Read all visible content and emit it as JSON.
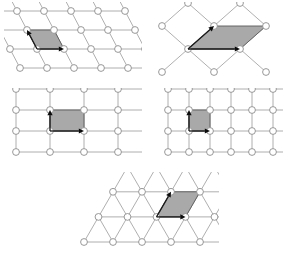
{
  "figure": {
    "background_color": "#ffffff",
    "width": 283,
    "height": 262,
    "style": {
      "edge_color": "#9a9a9a",
      "node_stroke_color": "#8c8c8c",
      "node_fill_color": "#ffffff",
      "node_radius": 3.4,
      "unit_cell_fill_color": "#a9a9a9",
      "unit_cell_stroke_color": "#5a5a5a",
      "vector_color": "#0d0d0d"
    }
  },
  "lattices": [
    {
      "id": "oblique",
      "name": "oblique-lattice",
      "panel": {
        "x": 4,
        "y": 2,
        "width": 138,
        "height": 82
      },
      "lattice_type": "oblique",
      "origin": {
        "x": 16,
        "y": 66
      },
      "a1": {
        "dx": 27,
        "dy": 0
      },
      "a2": {
        "dx": -10,
        "dy": -19
      },
      "cols": 5,
      "rows": 4,
      "unit_cell_origin_index": {
        "col": 1,
        "row": 1
      },
      "unit_cell_shape": "parallelogram",
      "vectors": [
        {
          "label": "a1",
          "direction": "right"
        },
        {
          "label": "a2",
          "direction": "up-left"
        }
      ]
    },
    {
      "id": "centered-rectangular",
      "name": "centered-rectangular-lattice",
      "panel": {
        "x": 150,
        "y": 2,
        "width": 133,
        "height": 82
      },
      "lattice_type": "centered rectangular (rhombic net)",
      "origin": {
        "x": 12,
        "y": 70
      },
      "a1": {
        "dx": 52,
        "dy": 0
      },
      "a2": {
        "dx": 26,
        "dy": -23
      },
      "cols": 3,
      "rows": 4,
      "unit_cell_shape": "rhombus",
      "vectors": [
        {
          "label": "a1",
          "direction": "right"
        },
        {
          "label": "a2",
          "direction": "up-left"
        }
      ]
    },
    {
      "id": "rectangular",
      "name": "rectangular-lattice",
      "panel": {
        "x": 4,
        "y": 88,
        "width": 138,
        "height": 82
      },
      "lattice_type": "rectangular",
      "origin": {
        "x": 12,
        "y": 64
      },
      "a1": {
        "dx": 34,
        "dy": 0
      },
      "a2": {
        "dx": 0,
        "dy": -21
      },
      "cols": 5,
      "rows": 4,
      "unit_cell_origin_index": {
        "col": 1,
        "row": 1
      },
      "unit_cell_shape": "rectangle",
      "vectors": [
        {
          "label": "a1",
          "direction": "right"
        },
        {
          "label": "a2",
          "direction": "up"
        }
      ]
    },
    {
      "id": "square",
      "name": "square-lattice",
      "panel": {
        "x": 150,
        "y": 88,
        "width": 133,
        "height": 82
      },
      "lattice_type": "square",
      "origin": {
        "x": 18,
        "y": 64
      },
      "a1": {
        "dx": 21,
        "dy": 0
      },
      "a2": {
        "dx": 0,
        "dy": -21
      },
      "cols": 6,
      "rows": 4,
      "unit_cell_origin_index": {
        "col": 1,
        "row": 1
      },
      "unit_cell_shape": "square",
      "vectors": [
        {
          "label": "a1",
          "direction": "right"
        },
        {
          "label": "a2",
          "direction": "up"
        }
      ]
    },
    {
      "id": "hexagonal",
      "name": "hexagonal-lattice",
      "panel": {
        "x": 64,
        "y": 172,
        "width": 155,
        "height": 88
      },
      "lattice_type": "hexagonal (triangular net)",
      "origin": {
        "x": 20,
        "y": 70
      },
      "a1": {
        "dx": 29,
        "dy": 0
      },
      "a2": {
        "dx": 14.5,
        "dy": -25.1
      },
      "cols": 5,
      "rows": 4,
      "unit_cell_origin_index": {
        "col": 2,
        "row": 1
      },
      "unit_cell_shape": "rhombus-60deg",
      "vectors": [
        {
          "label": "a1",
          "direction": "right"
        },
        {
          "label": "a2",
          "direction": "up-right"
        }
      ]
    }
  ]
}
